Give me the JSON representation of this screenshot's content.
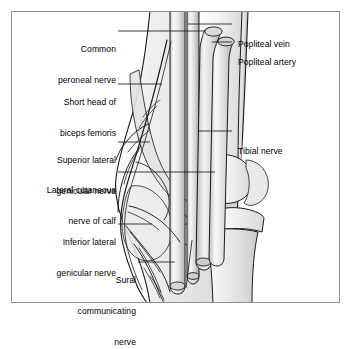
{
  "figure": {
    "border_color": "#8a8a8a",
    "background_color": "#ffffff",
    "line_color": "#1a1a1a",
    "shade_light": "#f2f2f2",
    "shade_mid": "#dcdcdc",
    "shade_dark": "#bdbdbd"
  },
  "labels": {
    "left": [
      {
        "id": "common-peroneal-nerve",
        "lines": [
          "Common",
          "peroneal nerve"
        ]
      },
      {
        "id": "short-head-biceps-femoris",
        "lines": [
          "Short head of",
          "biceps femoris"
        ]
      },
      {
        "id": "superior-lateral-genicular-nerve",
        "lines": [
          "Superior lateral",
          "genicular nerve"
        ]
      },
      {
        "id": "lateral-cutaneous-nerve-of-calf",
        "lines": [
          "Lateral cutaneous",
          "nerve of calf"
        ]
      },
      {
        "id": "inferior-lateral-genicular-nerve",
        "lines": [
          "Inferior lateral",
          "genicular nerve"
        ]
      },
      {
        "id": "sural-communicating-nerve",
        "lines": [
          "Sural",
          "communicating",
          "nerve"
        ]
      }
    ],
    "right": [
      {
        "id": "popliteal-vein",
        "lines": [
          "Popliteal vein"
        ]
      },
      {
        "id": "popliteal-artery",
        "lines": [
          "Popliteal artery"
        ]
      },
      {
        "id": "tibial-nerve",
        "lines": [
          "Tibial nerve"
        ]
      }
    ]
  },
  "label_text": {
    "common_peroneal_nerve_1": "Common",
    "common_peroneal_nerve_2": "peroneal nerve",
    "short_head_biceps_1": "Short head of",
    "short_head_biceps_2": "biceps femoris",
    "superior_lateral_genicular_1": "Superior lateral",
    "superior_lateral_genicular_2": "genicular nerve",
    "lateral_cutaneous_calf_1": "Lateral cutaneous",
    "lateral_cutaneous_calf_2": "nerve of calf",
    "inferior_lateral_genicular_1": "Inferior lateral",
    "inferior_lateral_genicular_2": "genicular nerve",
    "sural_communicating_1": "Sural",
    "sural_communicating_2": "communicating",
    "sural_communicating_3": "nerve",
    "popliteal_vein": "Popliteal vein",
    "popliteal_artery": "Popliteal artery",
    "tibial_nerve": "Tibial nerve"
  }
}
